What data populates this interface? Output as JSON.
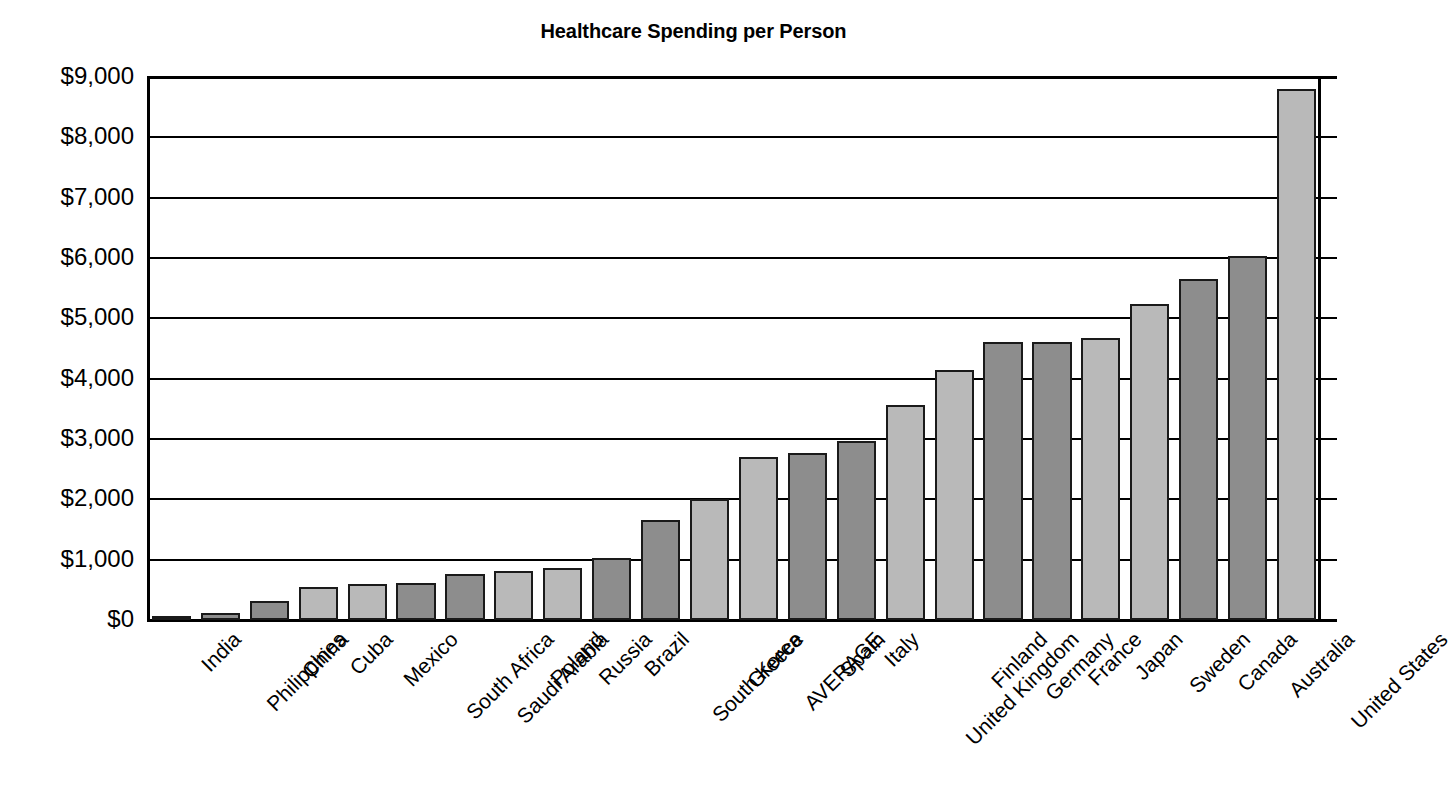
{
  "chart_data": {
    "type": "bar",
    "title": "Healthcare Spending per Person",
    "xlabel": "",
    "ylabel": "",
    "ylim": [
      0,
      9000
    ],
    "ytick_labels": [
      "$9,000",
      "$8,000",
      "$7,000",
      "$6,000",
      "$5,000",
      "$4,000",
      "$3,000",
      "$2,000",
      "$1,000",
      "$0"
    ],
    "ytick_values": [
      9000,
      8000,
      7000,
      6000,
      5000,
      4000,
      3000,
      2000,
      1000,
      0
    ],
    "grid": true,
    "legend": "none",
    "categories": [
      "India",
      "Philippines",
      "China",
      "Cuba",
      "Mexico",
      "South Africa",
      "Saudi Arabia",
      "Poland",
      "Russia",
      "Brazil",
      "South Korea",
      "Greece",
      "AVERAGE",
      "Spain",
      "Italy",
      "United Kingdom",
      "Finland",
      "Germany",
      "France",
      "Japan",
      "Sweden",
      "Canada",
      "Australia",
      "United States"
    ],
    "values": [
      65,
      120,
      310,
      540,
      590,
      620,
      760,
      820,
      860,
      1020,
      1660,
      2000,
      2710,
      2760,
      2960,
      3570,
      4150,
      4600,
      4600,
      4670,
      5230,
      5660,
      6030,
      8800
    ],
    "bar_shades": [
      "dark",
      "dark",
      "dark",
      "light",
      "light",
      "dark",
      "dark",
      "light",
      "light",
      "dark",
      "dark",
      "light",
      "light",
      "dark",
      "dark",
      "light",
      "light",
      "dark",
      "dark",
      "light",
      "light",
      "dark",
      "dark",
      "light"
    ],
    "colors": {
      "bar_light": "#b9b9b9",
      "bar_dark": "#8d8d8d",
      "bar_edge": "#1a1a1a",
      "axis": "#000000",
      "background": "#ffffff",
      "text": "#000000"
    }
  }
}
